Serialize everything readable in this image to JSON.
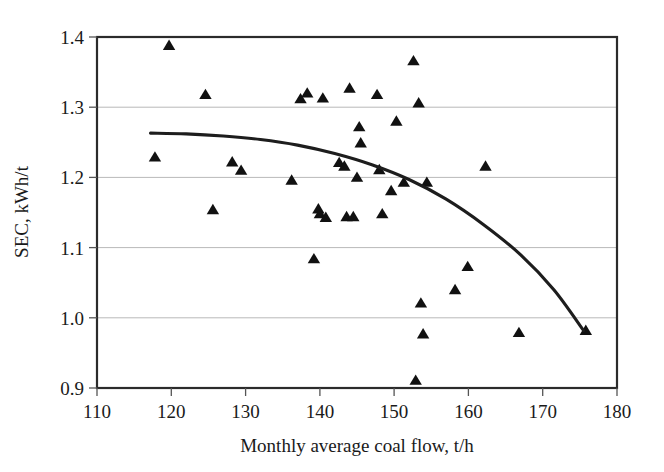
{
  "chart_data": {
    "type": "scatter",
    "title": "",
    "xlabel": "Monthly average coal flow, t/h",
    "ylabel": "SEC, kWh/t",
    "xlim": [
      110,
      180
    ],
    "ylim": [
      0.9,
      1.4
    ],
    "xticks": [
      110,
      120,
      130,
      140,
      150,
      160,
      170,
      180
    ],
    "xtick_labels": [
      "110",
      "120",
      "130",
      "140",
      "150",
      "160",
      "170",
      "180"
    ],
    "yticks": [
      0.9,
      1.0,
      1.1,
      1.2,
      1.3,
      1.4
    ],
    "ytick_labels": [
      "0.9",
      "1.0",
      "1.1",
      "1.2",
      "1.3",
      "1.4"
    ],
    "grid": "horizontal",
    "legend": "none",
    "marker_shape": "triangle",
    "marker_color": "#111111",
    "series": [
      {
        "name": "Monthly SEC observations",
        "marker": "triangle",
        "points": [
          [
            117.8,
            1.229
          ],
          [
            119.7,
            1.388
          ],
          [
            124.6,
            1.318
          ],
          [
            125.6,
            1.154
          ],
          [
            128.2,
            1.222
          ],
          [
            129.4,
            1.21
          ],
          [
            136.2,
            1.196
          ],
          [
            137.4,
            1.312
          ],
          [
            138.3,
            1.32
          ],
          [
            139.2,
            1.084
          ],
          [
            139.8,
            1.155
          ],
          [
            140.0,
            1.148
          ],
          [
            140.4,
            1.313
          ],
          [
            140.8,
            1.143
          ],
          [
            142.6,
            1.221
          ],
          [
            143.3,
            1.216
          ],
          [
            143.6,
            1.144
          ],
          [
            144.0,
            1.327
          ],
          [
            144.5,
            1.144
          ],
          [
            145.0,
            1.2
          ],
          [
            145.3,
            1.272
          ],
          [
            145.5,
            1.249
          ],
          [
            147.7,
            1.318
          ],
          [
            148.0,
            1.211
          ],
          [
            148.4,
            1.148
          ],
          [
            149.6,
            1.181
          ],
          [
            150.3,
            1.28
          ],
          [
            151.3,
            1.193
          ],
          [
            152.6,
            1.366
          ],
          [
            152.9,
            0.911
          ],
          [
            153.3,
            1.306
          ],
          [
            153.6,
            1.021
          ],
          [
            153.9,
            0.977
          ],
          [
            154.4,
            1.193
          ],
          [
            158.2,
            1.04
          ],
          [
            159.9,
            1.073
          ],
          [
            162.3,
            1.216
          ],
          [
            166.8,
            0.979
          ],
          [
            175.8,
            0.982
          ]
        ]
      }
    ],
    "trend_line": {
      "name": "fitted quadratic trend",
      "style": "solid",
      "color": "#1d1d1d",
      "points": [
        [
          117.2,
          1.263
        ],
        [
          122.0,
          1.262
        ],
        [
          127.0,
          1.259
        ],
        [
          132.0,
          1.254
        ],
        [
          137.0,
          1.246
        ],
        [
          142.0,
          1.234
        ],
        [
          147.0,
          1.218
        ],
        [
          152.0,
          1.197
        ],
        [
          157.0,
          1.169
        ],
        [
          162.0,
          1.133
        ],
        [
          167.0,
          1.09
        ],
        [
          171.5,
          1.04
        ],
        [
          175.5,
          0.982
        ]
      ]
    }
  },
  "axes": {
    "x_title": "Monthly average coal flow, t/h",
    "y_title": "SEC, kWh/t"
  }
}
